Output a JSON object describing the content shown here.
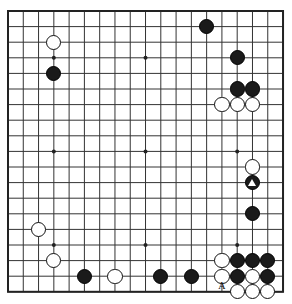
{
  "diagram": {
    "kind": "go-board-diagram",
    "board_size": 19,
    "geometry": {
      "origin_x": 8,
      "origin_y": 11,
      "step_x": 15.28,
      "step_y": 15.6,
      "stone_radius": 7.6,
      "border_thickness": 2.0,
      "line_thickness": 1.0,
      "star_radius": 2.0
    },
    "colors": {
      "background": "#ffffff",
      "line": "#333333",
      "border": "#222222",
      "black_stone": "#1a1a1a",
      "white_stone": "#ffffff",
      "white_stone_edge": "#111111",
      "mark": "#ffffff",
      "label_text": "#111111"
    },
    "star_points": [
      {
        "col": 4,
        "row": 4
      },
      {
        "col": 10,
        "row": 4
      },
      {
        "col": 16,
        "row": 4
      },
      {
        "col": 4,
        "row": 10
      },
      {
        "col": 10,
        "row": 10
      },
      {
        "col": 16,
        "row": 10
      },
      {
        "col": 4,
        "row": 16
      },
      {
        "col": 10,
        "row": 16
      },
      {
        "col": 16,
        "row": 16
      }
    ],
    "stones": [
      {
        "col": 4,
        "row": 3,
        "color": "white",
        "mark": null
      },
      {
        "col": 4,
        "row": 5,
        "color": "black",
        "mark": null
      },
      {
        "col": 14,
        "row": 2,
        "color": "black",
        "mark": null
      },
      {
        "col": 16,
        "row": 4,
        "color": "black",
        "mark": null
      },
      {
        "col": 16,
        "row": 6,
        "color": "black",
        "mark": null
      },
      {
        "col": 17,
        "row": 6,
        "color": "black",
        "mark": null
      },
      {
        "col": 15,
        "row": 7,
        "color": "white",
        "mark": null
      },
      {
        "col": 16,
        "row": 7,
        "color": "white",
        "mark": null
      },
      {
        "col": 17,
        "row": 7,
        "color": "white",
        "mark": null
      },
      {
        "col": 17,
        "row": 11,
        "color": "white",
        "mark": null
      },
      {
        "col": 17,
        "row": 12,
        "color": "black",
        "mark": "triangle"
      },
      {
        "col": 17,
        "row": 14,
        "color": "black",
        "mark": null
      },
      {
        "col": 3,
        "row": 15,
        "color": "white",
        "mark": null
      },
      {
        "col": 4,
        "row": 17,
        "color": "white",
        "mark": null
      },
      {
        "col": 6,
        "row": 18,
        "color": "black",
        "mark": null
      },
      {
        "col": 8,
        "row": 18,
        "color": "white",
        "mark": null
      },
      {
        "col": 11,
        "row": 18,
        "color": "black",
        "mark": null
      },
      {
        "col": 13,
        "row": 18,
        "color": "black",
        "mark": null
      },
      {
        "col": 15,
        "row": 17,
        "color": "white",
        "mark": null
      },
      {
        "col": 16,
        "row": 17,
        "color": "black",
        "mark": null
      },
      {
        "col": 17,
        "row": 17,
        "color": "black",
        "mark": null
      },
      {
        "col": 18,
        "row": 17,
        "color": "black",
        "mark": null
      },
      {
        "col": 15,
        "row": 18,
        "color": "white",
        "mark": null
      },
      {
        "col": 16,
        "row": 18,
        "color": "black",
        "mark": null
      },
      {
        "col": 17,
        "row": 18,
        "color": "white",
        "mark": null
      },
      {
        "col": 18,
        "row": 18,
        "color": "black",
        "mark": null
      },
      {
        "col": 16,
        "row": 19,
        "color": "white",
        "mark": null
      },
      {
        "col": 17,
        "row": 19,
        "color": "white",
        "mark": null
      },
      {
        "col": 18,
        "row": 19,
        "color": "white",
        "mark": null
      }
    ],
    "labels": [
      {
        "col": 15,
        "row": 19,
        "text": "A"
      }
    ]
  }
}
